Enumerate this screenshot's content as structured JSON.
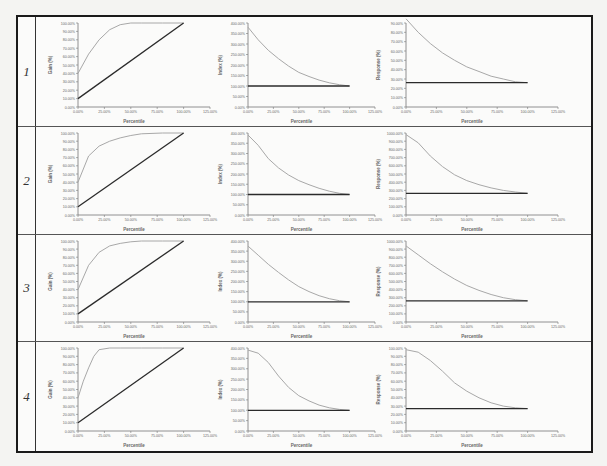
{
  "figure": {
    "rows": [
      {
        "label": "1"
      },
      {
        "label": "2"
      },
      {
        "label": "3"
      },
      {
        "label": "4"
      }
    ]
  },
  "colors": {
    "curve": "#a8a8a8",
    "baseline": "#2b2b2b",
    "axis": "#777777",
    "frame": "#1a1a1a"
  },
  "chart_data": [
    {
      "row": 1,
      "type": "line",
      "title": "",
      "xlabel": "Percentile",
      "ylabel": "Gain (%)",
      "x_ticks": [
        "0.00%",
        "25.00%",
        "50.00%",
        "75.00%",
        "100.00%",
        "125.00%"
      ],
      "y_ticks": [
        "0.00%",
        "10.00%",
        "20.00%",
        "30.00%",
        "40.00%",
        "50.00%",
        "60.00%",
        "70.00%",
        "80.00%",
        "90.00%",
        "100.00%"
      ],
      "xlim": [
        0,
        125
      ],
      "ylim": [
        0,
        100
      ],
      "grid": false,
      "legend": "none",
      "series": [
        {
          "name": "Model",
          "x": [
            0,
            10,
            20,
            30,
            40,
            50,
            60,
            80,
            100
          ],
          "values": [
            40,
            63,
            80,
            92,
            98,
            100,
            100,
            100,
            100
          ]
        },
        {
          "name": "Random",
          "x": [
            0,
            100
          ],
          "values": [
            10,
            100
          ]
        }
      ]
    },
    {
      "row": 1,
      "type": "line",
      "xlabel": "Percentile",
      "ylabel": "Index (%)",
      "x_ticks": [
        "0.00%",
        "25.00%",
        "50.00%",
        "75.00%",
        "100.00%",
        "125.00%"
      ],
      "y_ticks": [
        "0.00%",
        "50.00%",
        "100.00%",
        "150.00%",
        "200.00%",
        "250.00%",
        "300.00%",
        "350.00%",
        "400.00%"
      ],
      "xlim": [
        0,
        125
      ],
      "ylim": [
        0,
        400
      ],
      "grid": false,
      "legend": "none",
      "series": [
        {
          "name": "Model",
          "x": [
            0,
            10,
            20,
            30,
            40,
            50,
            60,
            70,
            80,
            90,
            100
          ],
          "values": [
            380,
            320,
            270,
            230,
            195,
            165,
            145,
            128,
            115,
            106,
            100
          ]
        },
        {
          "name": "Baseline",
          "x": [
            0,
            100
          ],
          "values": [
            100,
            100
          ]
        }
      ]
    },
    {
      "row": 1,
      "type": "line",
      "xlabel": "Percentile",
      "ylabel": "Response (%)",
      "x_ticks": [
        "0.00%",
        "25.00%",
        "50.00%",
        "75.00%",
        "100.00%",
        "125.00%"
      ],
      "y_ticks": [
        "0.00%",
        "10.00%",
        "20.00%",
        "30.00%",
        "40.00%",
        "50.00%",
        "60.00%",
        "70.00%",
        "80.00%",
        "90.00%"
      ],
      "xlim": [
        0,
        125
      ],
      "ylim": [
        0,
        90
      ],
      "grid": false,
      "legend": "none",
      "series": [
        {
          "name": "Model",
          "x": [
            0,
            10,
            20,
            30,
            40,
            50,
            60,
            70,
            80,
            90,
            100
          ],
          "values": [
            95,
            80,
            68,
            58,
            50,
            43,
            38,
            33,
            30,
            27,
            26
          ]
        },
        {
          "name": "Baseline",
          "x": [
            0,
            100
          ],
          "values": [
            26,
            26
          ]
        }
      ]
    },
    {
      "row": 2,
      "type": "line",
      "xlabel": "Percentile",
      "ylabel": "Gain (%)",
      "x_ticks": [
        "0.00%",
        "25.00%",
        "50.00%",
        "75.00%",
        "100.00%",
        "125.00%"
      ],
      "y_ticks": [
        "0.00%",
        "10.00%",
        "20.00%",
        "30.00%",
        "40.00%",
        "50.00%",
        "60.00%",
        "70.00%",
        "80.00%",
        "90.00%",
        "100.00%"
      ],
      "xlim": [
        0,
        125
      ],
      "ylim": [
        0,
        100
      ],
      "grid": false,
      "legend": "none",
      "series": [
        {
          "name": "Model",
          "x": [
            0,
            10,
            20,
            30,
            40,
            50,
            60,
            80,
            100
          ],
          "values": [
            40,
            72,
            84,
            90,
            94,
            97,
            99,
            100,
            100
          ]
        },
        {
          "name": "Random",
          "x": [
            0,
            100
          ],
          "values": [
            10,
            100
          ]
        }
      ]
    },
    {
      "row": 2,
      "type": "line",
      "xlabel": "Percentile",
      "ylabel": "Index (%)",
      "x_ticks": [
        "0.00%",
        "25.00%",
        "50.00%",
        "75.00%",
        "100.00%",
        "125.00%"
      ],
      "y_ticks": [
        "0.00%",
        "50.00%",
        "100.00%",
        "150.00%",
        "200.00%",
        "250.00%",
        "300.00%",
        "350.00%",
        "400.00%"
      ],
      "xlim": [
        0,
        125
      ],
      "ylim": [
        0,
        400
      ],
      "grid": false,
      "legend": "none",
      "series": [
        {
          "name": "Model",
          "x": [
            0,
            10,
            20,
            30,
            40,
            50,
            60,
            70,
            80,
            90,
            100
          ],
          "values": [
            390,
            340,
            275,
            230,
            195,
            168,
            148,
            130,
            116,
            106,
            100
          ]
        },
        {
          "name": "Baseline",
          "x": [
            0,
            100
          ],
          "values": [
            100,
            100
          ]
        }
      ]
    },
    {
      "row": 2,
      "type": "line",
      "xlabel": "Percentile",
      "ylabel": "Response (%)",
      "x_ticks": [
        "0.00%",
        "25.00%",
        "50.00%",
        "75.00%",
        "100.00%",
        "125.00%"
      ],
      "y_ticks": [
        "0.00%",
        "100.00%",
        "200.00%",
        "300.00%",
        "400.00%",
        "500.00%",
        "600.00%",
        "700.00%",
        "800.00%",
        "900.00%",
        "1000.00%"
      ],
      "xlim": [
        0,
        125
      ],
      "ylim": [
        0,
        1000
      ],
      "grid": false,
      "legend": "none",
      "series": [
        {
          "name": "Model",
          "x": [
            0,
            10,
            20,
            30,
            40,
            50,
            60,
            70,
            80,
            90,
            100
          ],
          "values": [
            980,
            880,
            720,
            590,
            490,
            420,
            370,
            330,
            300,
            280,
            265
          ]
        },
        {
          "name": "Baseline",
          "x": [
            0,
            100
          ],
          "values": [
            265,
            265
          ]
        }
      ]
    },
    {
      "row": 3,
      "type": "line",
      "xlabel": "Percentile",
      "ylabel": "Gain (%)",
      "x_ticks": [
        "0.00%",
        "25.00%",
        "50.00%",
        "75.00%",
        "100.00%",
        "125.00%"
      ],
      "y_ticks": [
        "0.00%",
        "10.00%",
        "20.00%",
        "30.00%",
        "40.00%",
        "50.00%",
        "60.00%",
        "70.00%",
        "80.00%",
        "90.00%",
        "100.00%"
      ],
      "xlim": [
        0,
        125
      ],
      "ylim": [
        0,
        100
      ],
      "grid": false,
      "legend": "none",
      "series": [
        {
          "name": "Model",
          "x": [
            0,
            10,
            20,
            30,
            40,
            50,
            60,
            80,
            100
          ],
          "values": [
            40,
            70,
            86,
            94,
            97,
            99,
            100,
            100,
            100
          ]
        },
        {
          "name": "Random",
          "x": [
            0,
            100
          ],
          "values": [
            10,
            100
          ]
        }
      ]
    },
    {
      "row": 3,
      "type": "line",
      "xlabel": "Percentile",
      "ylabel": "Index (%)",
      "x_ticks": [
        "0.00%",
        "25.00%",
        "50.00%",
        "75.00%",
        "100.00%",
        "125.00%"
      ],
      "y_ticks": [
        "0.00%",
        "50.00%",
        "100.00%",
        "150.00%",
        "200.00%",
        "250.00%",
        "300.00%",
        "350.00%",
        "400.00%"
      ],
      "xlim": [
        0,
        125
      ],
      "ylim": [
        0,
        400
      ],
      "grid": false,
      "legend": "none",
      "series": [
        {
          "name": "Model",
          "x": [
            0,
            10,
            20,
            30,
            40,
            50,
            60,
            70,
            80,
            90,
            100
          ],
          "values": [
            375,
            330,
            285,
            245,
            208,
            175,
            150,
            130,
            115,
            105,
            100
          ]
        },
        {
          "name": "Baseline",
          "x": [
            0,
            100
          ],
          "values": [
            100,
            100
          ]
        }
      ]
    },
    {
      "row": 3,
      "type": "line",
      "xlabel": "Percentile",
      "ylabel": "Response (%)",
      "x_ticks": [
        "0.00%",
        "25.00%",
        "50.00%",
        "75.00%",
        "100.00%",
        "125.00%"
      ],
      "y_ticks": [
        "0.00%",
        "100.00%",
        "200.00%",
        "300.00%",
        "400.00%",
        "500.00%",
        "600.00%",
        "700.00%",
        "800.00%",
        "900.00%",
        "1000.00%"
      ],
      "xlim": [
        0,
        125
      ],
      "ylim": [
        0,
        1000
      ],
      "grid": false,
      "legend": "none",
      "series": [
        {
          "name": "Model",
          "x": [
            0,
            10,
            20,
            30,
            40,
            50,
            60,
            70,
            80,
            90,
            100
          ],
          "values": [
            940,
            830,
            720,
            620,
            530,
            450,
            390,
            340,
            300,
            275,
            262
          ]
        },
        {
          "name": "Baseline",
          "x": [
            0,
            100
          ],
          "values": [
            262,
            262
          ]
        }
      ]
    },
    {
      "row": 4,
      "type": "line",
      "xlabel": "Percentile",
      "ylabel": "Gain (%)",
      "x_ticks": [
        "0.00%",
        "25.00%",
        "50.00%",
        "75.00%",
        "100.00%",
        "125.00%"
      ],
      "y_ticks": [
        "0.00%",
        "10.00%",
        "20.00%",
        "30.00%",
        "40.00%",
        "50.00%",
        "60.00%",
        "70.00%",
        "80.00%",
        "90.00%",
        "100.00%"
      ],
      "xlim": [
        0,
        125
      ],
      "ylim": [
        0,
        100
      ],
      "grid": false,
      "legend": "none",
      "series": [
        {
          "name": "Model",
          "x": [
            0,
            5,
            10,
            15,
            20,
            30,
            40,
            60,
            80,
            100
          ],
          "values": [
            40,
            60,
            76,
            90,
            98,
            100,
            100,
            100,
            100,
            100
          ]
        },
        {
          "name": "Random",
          "x": [
            0,
            100
          ],
          "values": [
            10,
            100
          ]
        }
      ]
    },
    {
      "row": 4,
      "type": "line",
      "xlabel": "Percentile",
      "ylabel": "Index (%)",
      "x_ticks": [
        "0.00%",
        "25.00%",
        "50.00%",
        "75.00%",
        "100.00%",
        "125.00%"
      ],
      "y_ticks": [
        "0.00%",
        "50.00%",
        "100.00%",
        "150.00%",
        "200.00%",
        "250.00%",
        "300.00%",
        "350.00%",
        "400.00%"
      ],
      "xlim": [
        0,
        125
      ],
      "ylim": [
        0,
        400
      ],
      "grid": false,
      "legend": "none",
      "series": [
        {
          "name": "Model",
          "x": [
            0,
            10,
            20,
            30,
            40,
            50,
            60,
            70,
            80,
            90,
            100
          ],
          "values": [
            390,
            375,
            330,
            265,
            210,
            170,
            145,
            125,
            112,
            104,
            100
          ]
        },
        {
          "name": "Baseline",
          "x": [
            0,
            100
          ],
          "values": [
            100,
            100
          ]
        }
      ]
    },
    {
      "row": 4,
      "type": "line",
      "xlabel": "Percentile",
      "ylabel": "Response (%)",
      "x_ticks": [
        "0.00%",
        "25.00%",
        "50.00%",
        "75.00%",
        "100.00%",
        "125.00%"
      ],
      "y_ticks": [
        "0.00%",
        "10.00%",
        "20.00%",
        "30.00%",
        "40.00%",
        "50.00%",
        "60.00%",
        "70.00%",
        "80.00%",
        "90.00%",
        "100.00%"
      ],
      "xlim": [
        0,
        125
      ],
      "ylim": [
        0,
        100
      ],
      "grid": false,
      "legend": "none",
      "series": [
        {
          "name": "Model",
          "x": [
            0,
            10,
            20,
            30,
            40,
            50,
            60,
            70,
            80,
            90,
            100
          ],
          "values": [
            98,
            95,
            85,
            72,
            58,
            48,
            40,
            34,
            30,
            28,
            27
          ]
        },
        {
          "name": "Baseline",
          "x": [
            0,
            100
          ],
          "values": [
            27,
            27
          ]
        }
      ]
    }
  ]
}
